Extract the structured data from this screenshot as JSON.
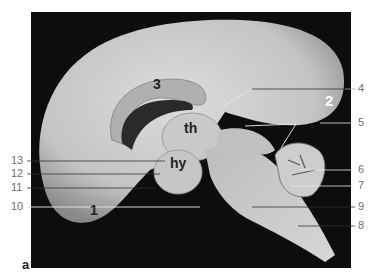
{
  "figure": {
    "panel_letter": "a",
    "region_labels": [
      {
        "id": "1",
        "text": "1",
        "x": 90,
        "y": 210,
        "color": "#222222",
        "size": 14
      },
      {
        "id": "2",
        "text": "2",
        "x": 325,
        "y": 100,
        "color": "#ffffff",
        "size": 15
      },
      {
        "id": "3",
        "text": "3",
        "x": 153,
        "y": 84,
        "color": "#222222",
        "size": 14
      },
      {
        "id": "th",
        "text": "th",
        "x": 184,
        "y": 128,
        "color": "#222222",
        "size": 14
      },
      {
        "id": "hy",
        "text": "hy",
        "x": 170,
        "y": 163,
        "color": "#222222",
        "size": 14
      }
    ],
    "callouts_right": [
      {
        "text": "4",
        "y": 89
      },
      {
        "text": "5",
        "y": 123
      },
      {
        "text": "6",
        "y": 170
      },
      {
        "text": "7",
        "y": 186
      },
      {
        "text": "9",
        "y": 207
      },
      {
        "text": "8",
        "y": 226
      }
    ],
    "callouts_left": [
      {
        "text": "13",
        "y": 161
      },
      {
        "text": "12",
        "y": 174
      },
      {
        "text": "11",
        "y": 188
      },
      {
        "text": "10",
        "y": 207
      }
    ]
  },
  "colors": {
    "background": "#0d0d0d",
    "tissue": "#cfcfcf",
    "tissue_dark": "#9a9a9a",
    "leader_dark": "#333333",
    "leader_light": "#e8e8e8",
    "label_text": "#6f6f6f"
  }
}
